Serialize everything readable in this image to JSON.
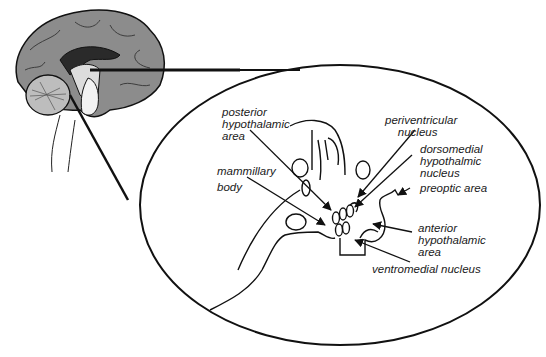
{
  "figure": {
    "colors": {
      "brain_fill": "#8c8c8c",
      "brain_light": "#c8c8c8",
      "ventricle_dark": "#2a2a2a",
      "line": "#111111",
      "background": "#ffffff"
    }
  },
  "labels": {
    "posterior_hypothalamic_area": "posterior\nhypothalamic\narea",
    "mammillary_body": "mammillary\nbody",
    "periventricular_nucleus": "periventricular\n    nucleus",
    "dorsomedial_hypothalamic_nucleus": "dorsomedial\nhypothalmic\nnucleus",
    "preoptic_area": "preoptic area",
    "anterior_hypothalamic_area": "anterior\nhypothalamic\narea",
    "ventromedial_nucleus": "ventromedial nucleus"
  }
}
